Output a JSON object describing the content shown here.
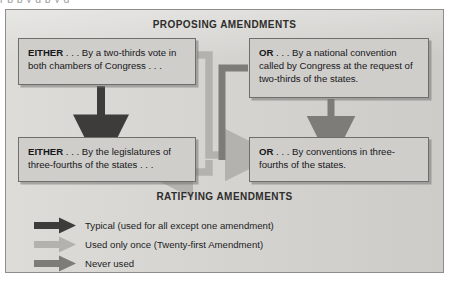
{
  "page": {
    "top_cut_text": "r p p y g p y g",
    "background": "#d5d4d0"
  },
  "headings": {
    "proposing": "PROPOSING AMENDMENTS",
    "ratifying": "RATIFYING AMENDMENTS"
  },
  "boxes": {
    "propose_either": {
      "lead": "EITHER",
      "text": " . . . By a two-thirds vote in both chambers of Congress . . ."
    },
    "propose_or": {
      "lead": "OR",
      "text": " . . . By a national convention called by Congress at the request of two-thirds of the states."
    },
    "ratify_either": {
      "lead": "EITHER",
      "text": " . . . By the legislatures of three-fourths of the states . . ."
    },
    "ratify_or": {
      "lead": "OR",
      "text": " . . . By conventions in three-fourths of the states."
    }
  },
  "legend": {
    "items": [
      {
        "label": "Typical (used for all except one amendment)",
        "color": "#3d3c3a",
        "name": "typical"
      },
      {
        "label": "Used only once (Twenty-first Amendment)",
        "color": "#b3b2ae",
        "name": "used-once"
      },
      {
        "label": "Never used",
        "color": "#7d7c79",
        "name": "never-used"
      }
    ]
  },
  "colors": {
    "arrow_typical": "#3d3c3a",
    "arrow_used_once": "#b3b2ae",
    "arrow_never_used": "#7d7c79",
    "panel_fill": "#d5d4d0",
    "box_fill": "#cfcecb",
    "box_border": "#6f6e6b",
    "panel_border": "#8e8d89"
  }
}
